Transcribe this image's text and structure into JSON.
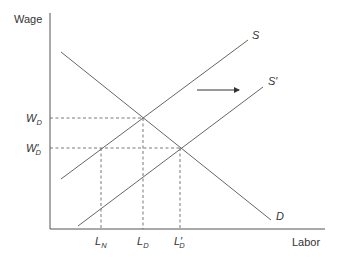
{
  "diagram": {
    "type": "labor-market-supply-demand",
    "axes": {
      "y_label": "Wage",
      "x_label": "Labor"
    },
    "curves": {
      "demand": {
        "label": "D"
      },
      "supply": {
        "label": "S"
      },
      "supply_shifted": {
        "label": "S′"
      }
    },
    "wage_levels": {
      "w_d": {
        "main": "W",
        "sub": "D"
      },
      "w_d_prime": {
        "main": "W′",
        "sub": "D"
      }
    },
    "labor_levels": {
      "l_n": {
        "main": "L",
        "sub": "N"
      },
      "l_d": {
        "main": "L",
        "sub": "D"
      },
      "l_d_prime": {
        "main": "L′",
        "sub": "D"
      }
    },
    "shift_arrow": {
      "direction": "right"
    },
    "colors": {
      "line": "#666666",
      "text": "#333333",
      "background": "#ffffff"
    }
  }
}
